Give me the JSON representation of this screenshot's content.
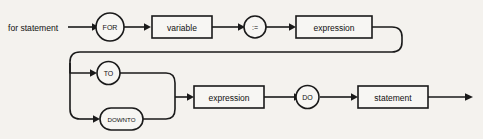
{
  "diagram": {
    "kind": "railroad-syntax-diagram",
    "entry_label": "for statement",
    "background_color": "#f4f2ee",
    "line_color": "#1a1a1a",
    "box_fill": "#f7f6f3",
    "nodes": {
      "for_keyword": {
        "label": "FOR",
        "shape": "circle"
      },
      "variable": {
        "label": "variable",
        "shape": "rect"
      },
      "assign_operator": {
        "label": ":=",
        "shape": "circle"
      },
      "expression_top": {
        "label": "expression",
        "shape": "rect"
      },
      "to_keyword": {
        "label": "TO",
        "shape": "circle"
      },
      "downto_keyword": {
        "label": "DOWNTO",
        "shape": "stadium"
      },
      "expression_bottom": {
        "label": "expression",
        "shape": "rect"
      },
      "do_keyword": {
        "label": "DO",
        "shape": "circle"
      },
      "statement": {
        "label": "statement",
        "shape": "rect"
      }
    },
    "icons": {
      "arrow_right": "arrow-right-icon"
    }
  }
}
